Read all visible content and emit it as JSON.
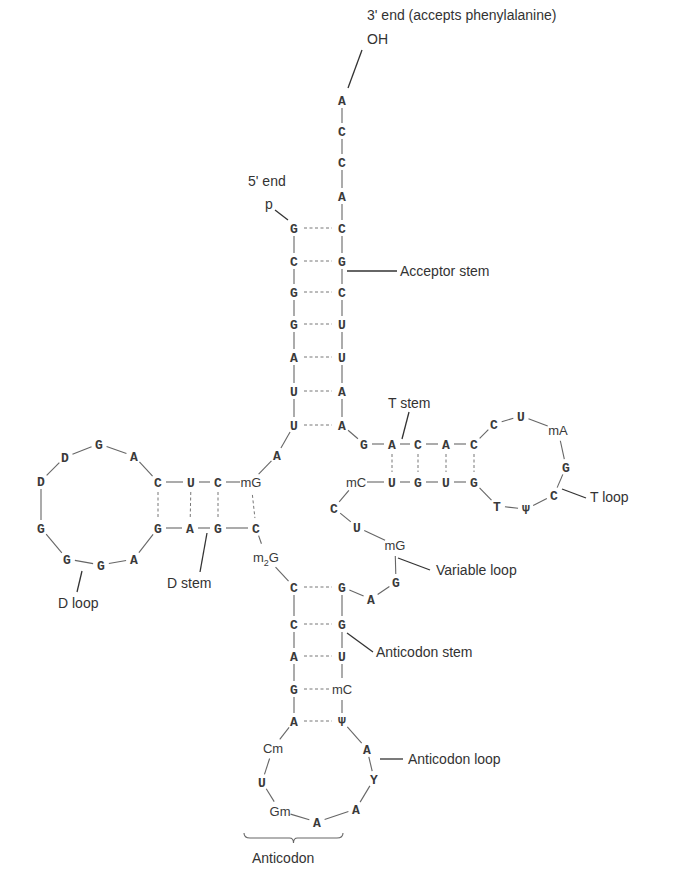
{
  "labels": [
    {
      "id": "three-prime-end",
      "text": "3' end (accepts phenylalanine)",
      "x": 367,
      "y": 20
    },
    {
      "id": "oh",
      "text": "OH",
      "x": 367,
      "y": 44
    },
    {
      "id": "five-prime-end",
      "text": "5' end",
      "x": 248,
      "y": 186
    },
    {
      "id": "phosphate",
      "text": "p",
      "x": 265,
      "y": 209
    },
    {
      "id": "acceptor-stem",
      "text": "Acceptor stem",
      "x": 400,
      "y": 276
    },
    {
      "id": "t-stem",
      "text": "T stem",
      "x": 388,
      "y": 408
    },
    {
      "id": "t-loop",
      "text": "T loop",
      "x": 590,
      "y": 502
    },
    {
      "id": "d-stem",
      "text": "D stem",
      "x": 167,
      "y": 588
    },
    {
      "id": "d-loop",
      "text": "D loop",
      "x": 58,
      "y": 608
    },
    {
      "id": "variable-loop",
      "text": "Variable loop",
      "x": 436,
      "y": 575
    },
    {
      "id": "anticodon-stem",
      "text": "Anticodon stem",
      "x": 376,
      "y": 657
    },
    {
      "id": "anticodon-loop",
      "text": "Anticodon loop",
      "x": 408,
      "y": 764
    },
    {
      "id": "anticodon",
      "text": "Anticodon",
      "x": 252,
      "y": 863
    }
  ],
  "nucleotides": [
    {
      "id": "acc-3-A",
      "base": "A",
      "x": 342,
      "y": 100,
      "mod": false
    },
    {
      "id": "acc-3-C1",
      "base": "C",
      "x": 342,
      "y": 131,
      "mod": false
    },
    {
      "id": "acc-3-C2",
      "base": "C",
      "x": 342,
      "y": 162,
      "mod": false
    },
    {
      "id": "acc-3-A2",
      "base": "A",
      "x": 342,
      "y": 196,
      "mod": false
    },
    {
      "id": "acc-L1",
      "base": "G",
      "x": 294,
      "y": 228,
      "mod": false
    },
    {
      "id": "acc-L2",
      "base": "C",
      "x": 294,
      "y": 261,
      "mod": false
    },
    {
      "id": "acc-L3",
      "base": "G",
      "x": 294,
      "y": 292,
      "mod": false
    },
    {
      "id": "acc-L4",
      "base": "G",
      "x": 294,
      "y": 324,
      "mod": false
    },
    {
      "id": "acc-L5",
      "base": "A",
      "x": 294,
      "y": 357,
      "mod": false
    },
    {
      "id": "acc-L6",
      "base": "U",
      "x": 294,
      "y": 391,
      "mod": false
    },
    {
      "id": "acc-L7",
      "base": "U",
      "x": 294,
      "y": 425,
      "mod": false
    },
    {
      "id": "acc-R1",
      "base": "C",
      "x": 342,
      "y": 228,
      "mod": false
    },
    {
      "id": "acc-R2",
      "base": "G",
      "x": 342,
      "y": 261,
      "mod": false
    },
    {
      "id": "acc-R3",
      "base": "C",
      "x": 342,
      "y": 292,
      "mod": false
    },
    {
      "id": "acc-R4",
      "base": "U",
      "x": 342,
      "y": 324,
      "mod": false
    },
    {
      "id": "acc-R5",
      "base": "U",
      "x": 342,
      "y": 357,
      "mod": false
    },
    {
      "id": "acc-R6",
      "base": "A",
      "x": 342,
      "y": 391,
      "mod": false
    },
    {
      "id": "acc-R7",
      "base": "A",
      "x": 342,
      "y": 425,
      "mod": false
    },
    {
      "id": "link-A8",
      "base": "A",
      "x": 277,
      "y": 455,
      "mod": false
    },
    {
      "id": "d-top-1",
      "base": "mG",
      "x": 251,
      "y": 482,
      "mod": true
    },
    {
      "id": "d-top-2",
      "base": "C",
      "x": 218,
      "y": 482,
      "mod": false
    },
    {
      "id": "d-top-3",
      "base": "U",
      "x": 191,
      "y": 482,
      "mod": false
    },
    {
      "id": "d-top-4",
      "base": "C",
      "x": 158,
      "y": 482,
      "mod": false
    },
    {
      "id": "d-loop-1",
      "base": "A",
      "x": 134,
      "y": 456,
      "mod": false
    },
    {
      "id": "d-loop-2",
      "base": "G",
      "x": 99,
      "y": 444,
      "mod": false
    },
    {
      "id": "d-loop-3",
      "base": "D",
      "x": 65,
      "y": 457,
      "mod": false
    },
    {
      "id": "d-loop-4",
      "base": "D",
      "x": 41,
      "y": 481,
      "mod": false
    },
    {
      "id": "d-loop-5",
      "base": "G",
      "x": 41,
      "y": 528,
      "mod": false
    },
    {
      "id": "d-loop-6",
      "base": "G",
      "x": 67,
      "y": 559,
      "mod": false
    },
    {
      "id": "d-loop-7",
      "base": "G",
      "x": 101,
      "y": 565,
      "mod": false
    },
    {
      "id": "d-loop-8",
      "base": "A",
      "x": 134,
      "y": 559,
      "mod": false
    },
    {
      "id": "d-bot-1",
      "base": "G",
      "x": 158,
      "y": 528,
      "mod": false
    },
    {
      "id": "d-bot-2",
      "base": "A",
      "x": 190,
      "y": 528,
      "mod": false
    },
    {
      "id": "d-bot-3",
      "base": "G",
      "x": 218,
      "y": 528,
      "mod": false
    },
    {
      "id": "d-bot-4",
      "base": "C",
      "x": 256,
      "y": 528,
      "mod": false
    },
    {
      "id": "link-m2G",
      "base": "m2G",
      "x": 266,
      "y": 557,
      "mod": true
    },
    {
      "id": "ac-L1",
      "base": "C",
      "x": 294,
      "y": 587,
      "mod": false
    },
    {
      "id": "ac-L2",
      "base": "C",
      "x": 294,
      "y": 624,
      "mod": false
    },
    {
      "id": "ac-L3",
      "base": "A",
      "x": 294,
      "y": 656,
      "mod": false
    },
    {
      "id": "ac-L4",
      "base": "G",
      "x": 294,
      "y": 689,
      "mod": false
    },
    {
      "id": "ac-L5",
      "base": "A",
      "x": 294,
      "y": 721,
      "mod": false
    },
    {
      "id": "ac-loop-1",
      "base": "Cm",
      "x": 273,
      "y": 748,
      "mod": true
    },
    {
      "id": "ac-loop-2",
      "base": "U",
      "x": 262,
      "y": 782,
      "mod": false
    },
    {
      "id": "ac-loop-3",
      "base": "Gm",
      "x": 280,
      "y": 811,
      "mod": true
    },
    {
      "id": "ac-loop-4",
      "base": "A",
      "x": 317,
      "y": 822,
      "mod": false
    },
    {
      "id": "ac-loop-5",
      "base": "A",
      "x": 356,
      "y": 809,
      "mod": false
    },
    {
      "id": "ac-loop-6",
      "base": "Y",
      "x": 374,
      "y": 779,
      "mod": false
    },
    {
      "id": "ac-loop-7",
      "base": "A",
      "x": 367,
      "y": 749,
      "mod": false
    },
    {
      "id": "ac-R5",
      "base": "Ψ",
      "x": 342,
      "y": 721,
      "mod": false
    },
    {
      "id": "ac-R4",
      "base": "mC",
      "x": 342,
      "y": 689,
      "mod": true
    },
    {
      "id": "ac-R3",
      "base": "U",
      "x": 342,
      "y": 656,
      "mod": false
    },
    {
      "id": "ac-R2",
      "base": "G",
      "x": 342,
      "y": 624,
      "mod": false
    },
    {
      "id": "ac-R1",
      "base": "G",
      "x": 342,
      "y": 587,
      "mod": false
    },
    {
      "id": "var-1",
      "base": "A",
      "x": 371,
      "y": 599,
      "mod": false
    },
    {
      "id": "var-2",
      "base": "G",
      "x": 396,
      "y": 582,
      "mod": false
    },
    {
      "id": "var-3",
      "base": "mG",
      "x": 395,
      "y": 545,
      "mod": true
    },
    {
      "id": "var-4",
      "base": "U",
      "x": 357,
      "y": 527,
      "mod": false
    },
    {
      "id": "var-5",
      "base": "C",
      "x": 334,
      "y": 508,
      "mod": false
    },
    {
      "id": "t-bot-0",
      "base": "mC",
      "x": 356,
      "y": 482,
      "mod": true
    },
    {
      "id": "t-bot-1",
      "base": "U",
      "x": 392,
      "y": 482,
      "mod": false
    },
    {
      "id": "t-bot-2",
      "base": "G",
      "x": 418,
      "y": 482,
      "mod": false
    },
    {
      "id": "t-bot-3",
      "base": "U",
      "x": 446,
      "y": 482,
      "mod": false
    },
    {
      "id": "t-bot-4",
      "base": "G",
      "x": 474,
      "y": 482,
      "mod": false
    },
    {
      "id": "t-loop-1",
      "base": "T",
      "x": 497,
      "y": 506,
      "mod": false
    },
    {
      "id": "t-loop-2",
      "base": "Ψ",
      "x": 526,
      "y": 509,
      "mod": false
    },
    {
      "id": "t-loop-3",
      "base": "C",
      "x": 554,
      "y": 495,
      "mod": false
    },
    {
      "id": "t-loop-4",
      "base": "G",
      "x": 566,
      "y": 467,
      "mod": false
    },
    {
      "id": "t-loop-5",
      "base": "mA",
      "x": 558,
      "y": 430,
      "mod": true
    },
    {
      "id": "t-loop-6",
      "base": "U",
      "x": 521,
      "y": 416,
      "mod": false
    },
    {
      "id": "t-loop-7",
      "base": "C",
      "x": 494,
      "y": 424,
      "mod": false
    },
    {
      "id": "t-top-4",
      "base": "C",
      "x": 474,
      "y": 444,
      "mod": false
    },
    {
      "id": "t-top-3",
      "base": "A",
      "x": 446,
      "y": 444,
      "mod": false
    },
    {
      "id": "t-top-2",
      "base": "C",
      "x": 418,
      "y": 444,
      "mod": false
    },
    {
      "id": "t-top-1",
      "base": "A",
      "x": 392,
      "y": 444,
      "mod": false
    },
    {
      "id": "t-top-0",
      "base": "G",
      "x": 364,
      "y": 444,
      "mod": false
    }
  ],
  "backbone": [
    [
      "acc-3-A",
      "acc-3-C1"
    ],
    [
      "acc-3-C1",
      "acc-3-C2"
    ],
    [
      "acc-3-C2",
      "acc-3-A2"
    ],
    [
      "acc-3-A2",
      "acc-R1"
    ],
    [
      "acc-R1",
      "acc-R2"
    ],
    [
      "acc-R2",
      "acc-R3"
    ],
    [
      "acc-R3",
      "acc-R4"
    ],
    [
      "acc-R4",
      "acc-R5"
    ],
    [
      "acc-R5",
      "acc-R6"
    ],
    [
      "acc-R6",
      "acc-R7"
    ],
    [
      "acc-L1",
      "acc-L2"
    ],
    [
      "acc-L2",
      "acc-L3"
    ],
    [
      "acc-L3",
      "acc-L4"
    ],
    [
      "acc-L4",
      "acc-L5"
    ],
    [
      "acc-L5",
      "acc-L6"
    ],
    [
      "acc-L6",
      "acc-L7"
    ],
    [
      "acc-L7",
      "link-A8"
    ],
    [
      "link-A8",
      "d-top-1"
    ],
    [
      "d-top-1",
      "d-top-2"
    ],
    [
      "d-top-2",
      "d-top-3"
    ],
    [
      "d-top-3",
      "d-top-4"
    ],
    [
      "d-top-4",
      "d-loop-1"
    ],
    [
      "d-loop-1",
      "d-loop-2"
    ],
    [
      "d-loop-2",
      "d-loop-3"
    ],
    [
      "d-loop-3",
      "d-loop-4"
    ],
    [
      "d-loop-4",
      "d-loop-5"
    ],
    [
      "d-loop-5",
      "d-loop-6"
    ],
    [
      "d-loop-6",
      "d-loop-7"
    ],
    [
      "d-loop-7",
      "d-loop-8"
    ],
    [
      "d-loop-8",
      "d-bot-1"
    ],
    [
      "d-bot-1",
      "d-bot-2"
    ],
    [
      "d-bot-2",
      "d-bot-3"
    ],
    [
      "d-bot-3",
      "d-bot-4"
    ],
    [
      "d-bot-4",
      "link-m2G"
    ],
    [
      "link-m2G",
      "ac-L1"
    ],
    [
      "ac-L1",
      "ac-L2"
    ],
    [
      "ac-L2",
      "ac-L3"
    ],
    [
      "ac-L3",
      "ac-L4"
    ],
    [
      "ac-L4",
      "ac-L5"
    ],
    [
      "ac-L5",
      "ac-loop-1"
    ],
    [
      "ac-loop-1",
      "ac-loop-2"
    ],
    [
      "ac-loop-2",
      "ac-loop-3"
    ],
    [
      "ac-loop-3",
      "ac-loop-4"
    ],
    [
      "ac-loop-4",
      "ac-loop-5"
    ],
    [
      "ac-loop-5",
      "ac-loop-6"
    ],
    [
      "ac-loop-6",
      "ac-loop-7"
    ],
    [
      "ac-loop-7",
      "ac-R5"
    ],
    [
      "ac-R5",
      "ac-R4"
    ],
    [
      "ac-R4",
      "ac-R3"
    ],
    [
      "ac-R3",
      "ac-R2"
    ],
    [
      "ac-R2",
      "ac-R1"
    ],
    [
      "ac-R1",
      "var-1"
    ],
    [
      "var-1",
      "var-2"
    ],
    [
      "var-2",
      "var-3"
    ],
    [
      "var-3",
      "var-4"
    ],
    [
      "var-4",
      "var-5"
    ],
    [
      "var-5",
      "t-bot-0"
    ],
    [
      "t-bot-0",
      "t-bot-1"
    ],
    [
      "t-bot-1",
      "t-bot-2"
    ],
    [
      "t-bot-2",
      "t-bot-3"
    ],
    [
      "t-bot-3",
      "t-bot-4"
    ],
    [
      "t-bot-4",
      "t-loop-1"
    ],
    [
      "t-loop-1",
      "t-loop-2"
    ],
    [
      "t-loop-2",
      "t-loop-3"
    ],
    [
      "t-loop-3",
      "t-loop-4"
    ],
    [
      "t-loop-4",
      "t-loop-5"
    ],
    [
      "t-loop-5",
      "t-loop-6"
    ],
    [
      "t-loop-6",
      "t-loop-7"
    ],
    [
      "t-loop-7",
      "t-top-4"
    ],
    [
      "t-top-4",
      "t-top-3"
    ],
    [
      "t-top-3",
      "t-top-2"
    ],
    [
      "t-top-2",
      "t-top-1"
    ],
    [
      "t-top-1",
      "t-top-0"
    ],
    [
      "t-top-0",
      "acc-R7"
    ]
  ],
  "base_pairs": [
    [
      "acc-L1",
      "acc-R1"
    ],
    [
      "acc-L2",
      "acc-R2"
    ],
    [
      "acc-L3",
      "acc-R3"
    ],
    [
      "acc-L4",
      "acc-R4"
    ],
    [
      "acc-L5",
      "acc-R5"
    ],
    [
      "acc-L6",
      "acc-R6"
    ],
    [
      "acc-L7",
      "acc-R7"
    ],
    [
      "d-top-4",
      "d-bot-1"
    ],
    [
      "d-top-3",
      "d-bot-2"
    ],
    [
      "d-top-2",
      "d-bot-3"
    ],
    [
      "d-top-1",
      "d-bot-4"
    ],
    [
      "ac-L1",
      "ac-R1"
    ],
    [
      "ac-L2",
      "ac-R2"
    ],
    [
      "ac-L3",
      "ac-R3"
    ],
    [
      "ac-L4",
      "ac-R4"
    ],
    [
      "ac-L5",
      "ac-R5"
    ],
    [
      "t-top-1",
      "t-bot-1"
    ],
    [
      "t-top-2",
      "t-bot-2"
    ],
    [
      "t-top-3",
      "t-bot-3"
    ],
    [
      "t-top-4",
      "t-bot-4"
    ]
  ],
  "leaders": [
    {
      "id": "oh-leader",
      "x1": 362,
      "y1": 50,
      "x2": 348,
      "y2": 88
    },
    {
      "id": "p-leader",
      "x1": 275,
      "y1": 210,
      "x2": 288,
      "y2": 220
    },
    {
      "id": "acceptor-leader",
      "x1": 347,
      "y1": 271,
      "x2": 397,
      "y2": 271
    },
    {
      "id": "t-stem-leader",
      "x1": 409,
      "y1": 412,
      "x2": 402,
      "y2": 439
    },
    {
      "id": "t-loop-leader",
      "x1": 562,
      "y1": 489,
      "x2": 586,
      "y2": 498
    },
    {
      "id": "d-stem-leader",
      "x1": 207,
      "y1": 533,
      "x2": 200,
      "y2": 572
    },
    {
      "id": "d-loop-leader",
      "x1": 82,
      "y1": 571,
      "x2": 77,
      "y2": 592
    },
    {
      "id": "variable-leader",
      "x1": 398,
      "y1": 558,
      "x2": 430,
      "y2": 570
    },
    {
      "id": "anticodon-stem-leader",
      "x1": 347,
      "y1": 633,
      "x2": 373,
      "y2": 652
    },
    {
      "id": "anticodon-loop-leader",
      "x1": 380,
      "y1": 759,
      "x2": 403,
      "y2": 759
    }
  ],
  "brace": {
    "x1": 244,
    "x2": 343,
    "y": 838
  }
}
